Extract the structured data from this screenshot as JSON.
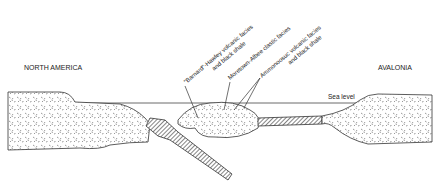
{
  "diagram": {
    "regions": {
      "left": "NORTH AMERICA",
      "right": "AVALONIA"
    },
    "sea_level_label": "Sea level",
    "facies_labels": [
      {
        "line1": "\"Barnard\"-Hawley volcanic facies",
        "line2": "and black shale"
      },
      {
        "line1": "Moretown-Albee clastic facies",
        "line2": ""
      },
      {
        "line1": "Ammonoosuc volcanic facies",
        "line2": "and black shale"
      }
    ],
    "colors": {
      "ink": "#333333",
      "background": "#ffffff"
    }
  }
}
